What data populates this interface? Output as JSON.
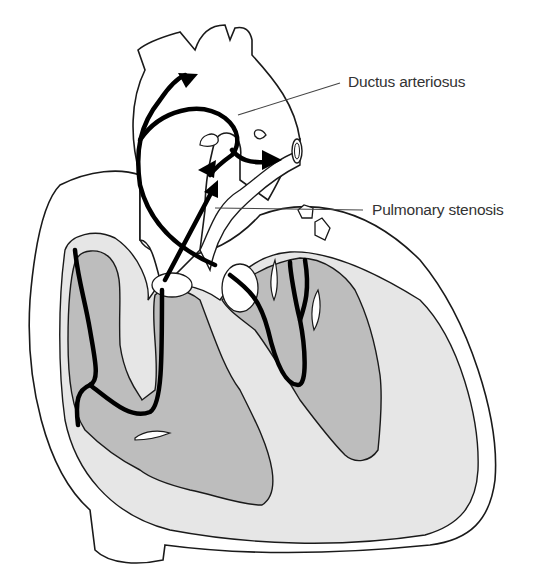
{
  "diagram": {
    "labels": [
      {
        "id": "ductus",
        "text": "Ductus arteriosus",
        "x": 348,
        "y": 73
      },
      {
        "id": "stenosis",
        "text": "Pulmonary stenosis",
        "x": 372,
        "y": 201
      }
    ],
    "colors": {
      "outline": "#1a1a1a",
      "flow_arrow": "#000000",
      "myocardium": "#e6e6e6",
      "chamber": "#bdbdbd",
      "vessel": "#ffffff",
      "label_text": "#333333",
      "leader_line": "#444444"
    },
    "flow_arrows": [
      {
        "id": "aorta-up",
        "description": "Flow up into aortic arch"
      },
      {
        "id": "ductus-left",
        "description": "Flow through ductus to pulmonary artery"
      },
      {
        "id": "ductus-right",
        "description": "Flow to right pulmonary artery"
      },
      {
        "id": "rv-outflow",
        "description": "Flow from right ventricle through stenotic pulmonary valve"
      }
    ]
  }
}
